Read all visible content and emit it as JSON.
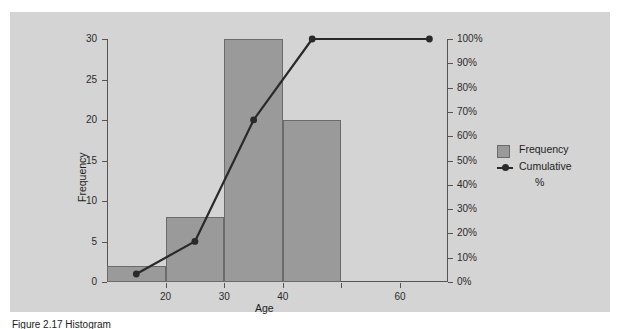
{
  "figure": {
    "panel_color": "#d4d4d4",
    "caption": "Figure 2.17  Histogram"
  },
  "legend": {
    "frequency_label": "Frequency",
    "cumulative_label": "Cumulative",
    "cumulative_label2": "%"
  },
  "chart_data": {
    "type": "bar",
    "title": "",
    "xlabel": "Age",
    "ylabel": "Frequency",
    "categories": [
      "15",
      "25",
      "35",
      "45"
    ],
    "bar_centers": [
      15,
      25,
      35,
      45
    ],
    "bar_width": 10,
    "values": [
      2,
      8,
      30,
      20
    ],
    "ylim": [
      0,
      30
    ],
    "yticks": [
      0,
      5,
      10,
      15,
      20,
      25,
      30
    ],
    "ytick_labels": [
      "0",
      "5",
      "10",
      "15",
      "20",
      "25",
      "30"
    ],
    "xlim": [
      10,
      68
    ],
    "xticks": [
      20,
      30,
      40,
      50,
      60
    ],
    "xtick_labels": [
      "20",
      "30",
      "40",
      "",
      "60"
    ],
    "grid": false,
    "legend_position": "right",
    "series": [
      {
        "name": "Frequency",
        "type": "bar",
        "values": [
          2,
          8,
          30,
          20
        ],
        "color": "#9a9a9a"
      },
      {
        "name": "Cumulative %",
        "type": "line",
        "axis": "secondary",
        "x": [
          15,
          25,
          35,
          45,
          65
        ],
        "values": [
          3.3,
          16.7,
          66.7,
          100,
          100
        ],
        "color": "#2a2a2a"
      }
    ],
    "secondary_axis": {
      "label": "",
      "ylim": [
        0,
        100
      ],
      "yticks": [
        0,
        10,
        20,
        30,
        40,
        50,
        60,
        70,
        80,
        90,
        100
      ],
      "ytick_labels": [
        "0%",
        "10%",
        "20%",
        "30%",
        "40%",
        "50%",
        "60%",
        "70%",
        "80%",
        "90%",
        "100%"
      ]
    }
  }
}
